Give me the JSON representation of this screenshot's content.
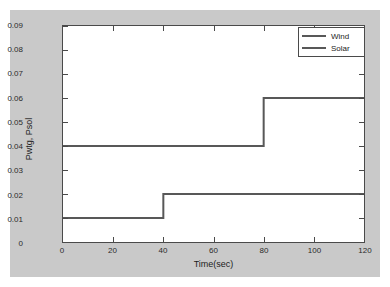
{
  "figure": {
    "background_color": "#c9c9c9",
    "plot_background_color": "#ffffff",
    "axis_color": "#4a4a4a"
  },
  "chart_data": {
    "type": "line",
    "title": "",
    "subtitle": "",
    "xlabel": "Time(sec)",
    "ylabel": "Pwtg, Psol",
    "xlim": [
      0,
      120
    ],
    "ylim": [
      0,
      0.09
    ],
    "xticks": [
      "0",
      "20",
      "40",
      "60",
      "80",
      "100",
      "120"
    ],
    "xtick_values": [
      0,
      20,
      40,
      60,
      80,
      100,
      120
    ],
    "yticks": [
      "0",
      "0.01",
      "0.02",
      "0.03",
      "0.04",
      "0.05",
      "0.06",
      "0.07",
      "0.08",
      "0.09"
    ],
    "ytick_values": [
      0,
      0.01,
      0.02,
      0.03,
      0.04,
      0.05,
      0.06,
      0.07,
      0.08,
      0.09
    ],
    "grid": false,
    "legend_position": "upper right",
    "drawstyle": "steps-post",
    "series": [
      {
        "name": "Wind",
        "color": "#585858",
        "x": [
          0,
          80,
          80,
          120
        ],
        "values": [
          0.04,
          0.04,
          0.06,
          0.06
        ],
        "steps": [
          {
            "from_time": 0,
            "to_time": 80,
            "value": 0.04
          },
          {
            "from_time": 80,
            "to_time": 120,
            "value": 0.06
          }
        ]
      },
      {
        "name": "Solar",
        "color": "#585858",
        "x": [
          0,
          40,
          40,
          120
        ],
        "values": [
          0.01,
          0.01,
          0.02,
          0.02
        ],
        "steps": [
          {
            "from_time": 0,
            "to_time": 40,
            "value": 0.01
          },
          {
            "from_time": 40,
            "to_time": 120,
            "value": 0.02
          }
        ]
      }
    ]
  },
  "legend": {
    "entries": [
      {
        "label": "Wind"
      },
      {
        "label": "Solar"
      }
    ]
  }
}
